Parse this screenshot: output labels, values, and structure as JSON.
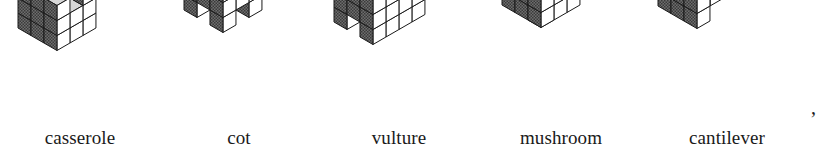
{
  "figure": {
    "caption_style": "serif-lowercase",
    "trailing_punctuation": ",",
    "palette": {
      "top_face": "#d7d7d7",
      "front_face": "#ffffff",
      "right_face": "#6e6e6e",
      "outline": "#1a1a1a",
      "label_color": "#1a1a1a",
      "background": "#ffffff"
    },
    "items": [
      {
        "label": "casserole",
        "name": "casserole",
        "center_x": 70,
        "cell_left": 0,
        "cell_width": 160,
        "cube": 15,
        "origin_x": 18,
        "origin_y": 28,
        "nx": 3,
        "ny": 3,
        "nz": 3,
        "voxels": [
          [
            0,
            0,
            0
          ],
          [
            1,
            0,
            0
          ],
          [
            2,
            0,
            0
          ],
          [
            0,
            1,
            0
          ],
          [
            1,
            1,
            0
          ],
          [
            2,
            1,
            0
          ],
          [
            0,
            2,
            0
          ],
          [
            1,
            2,
            0
          ],
          [
            2,
            2,
            0
          ],
          [
            0,
            0,
            1
          ],
          [
            1,
            0,
            1
          ],
          [
            2,
            0,
            1
          ],
          [
            0,
            1,
            1
          ],
          [
            1,
            1,
            1
          ],
          [
            2,
            1,
            1
          ],
          [
            0,
            2,
            1
          ],
          [
            1,
            2,
            1
          ],
          [
            2,
            2,
            1
          ],
          [
            0,
            0,
            2
          ],
          [
            1,
            0,
            2
          ],
          [
            2,
            0,
            2
          ],
          [
            0,
            1,
            2
          ],
          [
            1,
            1,
            2
          ],
          [
            0,
            2,
            2
          ],
          [
            1,
            2,
            2
          ],
          [
            2,
            2,
            2
          ]
        ]
      },
      {
        "label": "cot",
        "name": "cot",
        "center_x": 237,
        "cell_left": 160,
        "cell_width": 158,
        "cube": 15,
        "origin_x": 24,
        "origin_y": 10,
        "nx": 3,
        "ny": 3,
        "nz": 4,
        "voxels": [
          [
            0,
            0,
            0
          ],
          [
            2,
            0,
            0
          ],
          [
            0,
            2,
            0
          ],
          [
            2,
            2,
            0
          ],
          [
            0,
            0,
            1
          ],
          [
            1,
            0,
            1
          ],
          [
            2,
            0,
            1
          ],
          [
            0,
            1,
            1
          ],
          [
            1,
            1,
            1
          ],
          [
            2,
            1,
            1
          ],
          [
            0,
            2,
            1
          ],
          [
            1,
            2,
            1
          ],
          [
            2,
            2,
            1
          ],
          [
            2,
            0,
            2
          ],
          [
            2,
            1,
            2
          ],
          [
            2,
            2,
            2
          ],
          [
            2,
            0,
            3
          ],
          [
            1,
            0,
            3
          ],
          [
            0,
            0,
            3
          ],
          [
            2,
            1,
            3
          ],
          [
            1,
            1,
            3
          ],
          [
            0,
            1,
            3
          ],
          [
            2,
            2,
            3
          ],
          [
            1,
            2,
            3
          ],
          [
            0,
            2,
            3
          ]
        ]
      },
      {
        "label": "vulture",
        "name": "vulture",
        "center_x": 400,
        "cell_left": 318,
        "cell_width": 162,
        "cube": 15,
        "origin_x": 16,
        "origin_y": 22,
        "nx": 3,
        "ny": 4,
        "nz": 3,
        "voxels": [
          [
            0,
            0,
            0
          ],
          [
            2,
            0,
            0
          ],
          [
            0,
            1,
            0
          ],
          [
            2,
            1,
            0
          ],
          [
            0,
            2,
            0
          ],
          [
            2,
            2,
            0
          ],
          [
            0,
            3,
            0
          ],
          [
            2,
            3,
            0
          ],
          [
            0,
            0,
            1
          ],
          [
            1,
            0,
            1
          ],
          [
            2,
            0,
            1
          ],
          [
            0,
            1,
            1
          ],
          [
            1,
            1,
            1
          ],
          [
            2,
            1,
            1
          ],
          [
            0,
            2,
            1
          ],
          [
            1,
            2,
            1
          ],
          [
            2,
            2,
            1
          ],
          [
            0,
            3,
            1
          ],
          [
            1,
            3,
            1
          ],
          [
            2,
            3,
            1
          ],
          [
            0,
            0,
            2
          ],
          [
            1,
            0,
            2
          ],
          [
            2,
            0,
            2
          ],
          [
            0,
            1,
            2
          ],
          [
            1,
            1,
            2
          ],
          [
            2,
            1,
            2
          ],
          [
            0,
            2,
            2
          ],
          [
            1,
            2,
            2
          ],
          [
            2,
            2,
            2
          ],
          [
            0,
            3,
            2
          ],
          [
            1,
            3,
            2
          ],
          [
            2,
            3,
            2
          ]
        ]
      },
      {
        "label": "mushroom",
        "name": "mushroom",
        "center_x": 562,
        "cell_left": 480,
        "cell_width": 162,
        "cube": 15,
        "origin_x": 22,
        "origin_y": 20,
        "nx": 3,
        "ny": 3,
        "nz": 3,
        "voxels": [
          [
            1,
            1,
            0
          ],
          [
            0,
            0,
            1
          ],
          [
            1,
            0,
            1
          ],
          [
            2,
            0,
            1
          ],
          [
            0,
            1,
            1
          ],
          [
            1,
            1,
            1
          ],
          [
            2,
            1,
            1
          ],
          [
            0,
            2,
            1
          ],
          [
            1,
            2,
            1
          ],
          [
            2,
            2,
            1
          ],
          [
            0,
            0,
            2
          ],
          [
            1,
            0,
            2
          ],
          [
            2,
            0,
            2
          ],
          [
            0,
            1,
            2
          ],
          [
            1,
            1,
            2
          ],
          [
            2,
            1,
            2
          ],
          [
            0,
            2,
            2
          ],
          [
            1,
            2,
            2
          ],
          [
            2,
            2,
            2
          ],
          [
            0,
            0,
            3
          ],
          [
            1,
            0,
            3
          ],
          [
            2,
            0,
            3
          ],
          [
            0,
            1,
            3
          ],
          [
            1,
            1,
            3
          ],
          [
            2,
            1,
            3
          ],
          [
            0,
            2,
            3
          ],
          [
            1,
            2,
            3
          ],
          [
            2,
            2,
            3
          ]
        ]
      },
      {
        "label": "cantilever",
        "name": "cantilever",
        "center_x": 728,
        "cell_left": 642,
        "cell_width": 170,
        "cube": 15,
        "origin_x": 16,
        "origin_y": 6,
        "nx": 3,
        "ny": 3,
        "nz": 4,
        "voxels": [
          [
            0,
            0,
            0
          ],
          [
            1,
            0,
            0
          ],
          [
            2,
            0,
            0
          ],
          [
            0,
            1,
            0
          ],
          [
            1,
            1,
            0
          ],
          [
            0,
            2,
            0
          ],
          [
            1,
            2,
            0
          ],
          [
            1,
            0,
            1
          ],
          [
            2,
            0,
            1
          ],
          [
            1,
            1,
            1
          ],
          [
            1,
            2,
            1
          ],
          [
            0,
            0,
            2
          ],
          [
            1,
            0,
            2
          ],
          [
            2,
            0,
            2
          ],
          [
            0,
            1,
            2
          ],
          [
            1,
            1,
            2
          ],
          [
            2,
            1,
            2
          ],
          [
            0,
            2,
            2
          ],
          [
            1,
            2,
            2
          ],
          [
            2,
            2,
            2
          ],
          [
            0,
            0,
            3
          ],
          [
            1,
            0,
            3
          ],
          [
            2,
            0,
            3
          ],
          [
            0,
            1,
            3
          ],
          [
            1,
            1,
            3
          ],
          [
            2,
            1,
            3
          ],
          [
            0,
            2,
            3
          ],
          [
            1,
            2,
            3
          ],
          [
            2,
            2,
            3
          ]
        ]
      }
    ]
  }
}
